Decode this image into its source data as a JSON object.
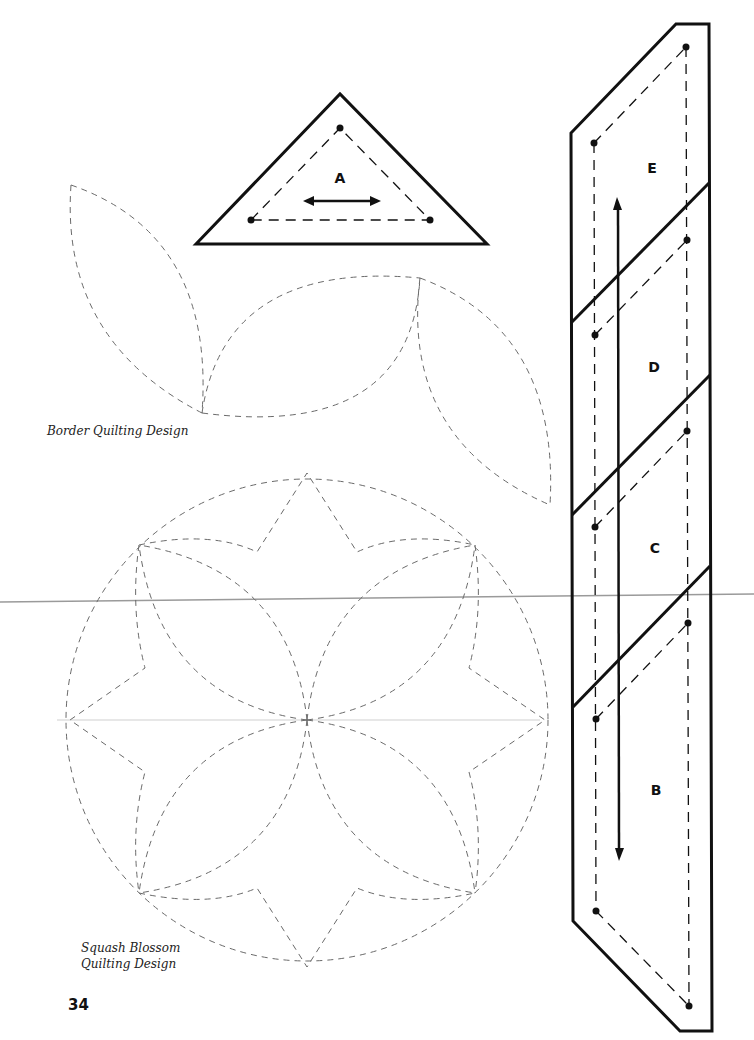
{
  "page": {
    "page_number": "34",
    "background": "#ffffff",
    "ink_color": "#111111",
    "dash_color": "#666666",
    "guide_line_color": "#999999"
  },
  "templates": {
    "triangle": {
      "label": "A",
      "grain": "horizontal-double-arrow"
    },
    "strip": {
      "pieces": [
        {
          "label": "E",
          "x": 652,
          "y": 168
        },
        {
          "label": "D",
          "x": 654,
          "y": 367
        },
        {
          "label": "C",
          "x": 655,
          "y": 548
        },
        {
          "label": "B",
          "x": 656,
          "y": 790
        }
      ],
      "grain": "vertical-double-arrow"
    }
  },
  "captions": {
    "border": "Border Quilting Design",
    "squash_line1": "Squash Blossom",
    "squash_line2": "Quilting Design"
  }
}
